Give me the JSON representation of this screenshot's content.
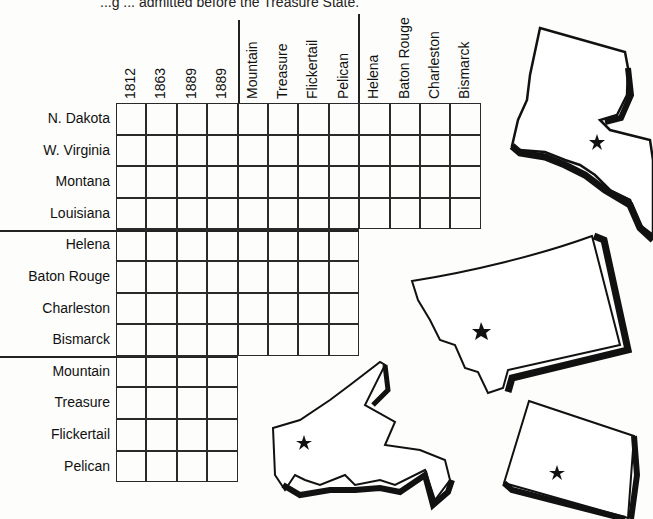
{
  "puzzle": {
    "clue_text": "...g ... admitted before the Treasure State.",
    "column_groups": [
      {
        "name": "years",
        "labels": [
          "1812",
          "1863",
          "1889",
          "1889"
        ]
      },
      {
        "name": "nicknames",
        "labels": [
          "Mountain",
          "Treasure",
          "Flickertail",
          "Pelican"
        ]
      },
      {
        "name": "capitals",
        "labels": [
          "Helena",
          "Baton Rouge",
          "Charleston",
          "Bismarck"
        ]
      }
    ],
    "row_groups": [
      {
        "name": "states",
        "labels": [
          "N. Dakota",
          "W. Virginia",
          "Montana",
          "Louisiana"
        ],
        "columns": 12
      },
      {
        "name": "capitals",
        "labels": [
          "Helena",
          "Baton Rouge",
          "Charleston",
          "Bismarck"
        ],
        "columns": 8
      },
      {
        "name": "nicknames",
        "labels": [
          "Mountain",
          "Treasure",
          "Flickertail",
          "Pelican"
        ],
        "columns": 4
      }
    ],
    "state_illustrations": [
      {
        "name": "Louisiana",
        "marker": "star-capital"
      },
      {
        "name": "Montana",
        "marker": "star-capital"
      },
      {
        "name": "West Virginia",
        "marker": "star-capital"
      },
      {
        "name": "North Dakota",
        "marker": "star-capital"
      }
    ]
  }
}
